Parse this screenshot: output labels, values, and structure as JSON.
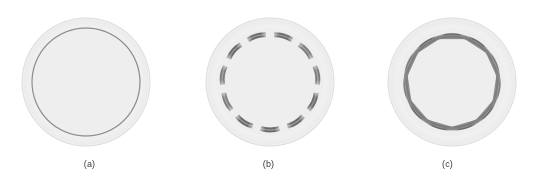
{
  "figure": {
    "width": 537,
    "height": 192,
    "background_color": "#ffffff",
    "panel_count": 3
  },
  "colors": {
    "background": "#ffffff",
    "outer_disc_fill": "#f2f2f2",
    "outer_disc_edge": "#dcdcdc",
    "inner_disc_fill": "#eeeeee",
    "thin_ring_stroke": "#8c8c8c",
    "segment_dark": "#7d7d7d",
    "segment_darker": "#6a6a6a",
    "segment_light": "#b4b4b4",
    "caption_text": "#3a3a3a"
  },
  "panels": [
    {
      "id": "panel-a",
      "caption": "(a)",
      "center_x": 86,
      "center_y": 82,
      "outer_radius": 64,
      "inner_radius": 54,
      "state": "unbuckled",
      "ring_style": "thin-continuous-circle",
      "segment_count": 0,
      "segment_thickness": 1.2,
      "polygon_amplitude": 0
    },
    {
      "id": "panel-b",
      "caption": "(b)",
      "center_x": 270,
      "center_y": 82,
      "outer_radius": 64,
      "inner_radius": 54,
      "state": "partially-buckled",
      "ring_style": "polygonal-with-detached-lobes",
      "segment_count": 11,
      "segment_thickness": 5.0,
      "polygon_amplitude": 5.5,
      "lobe_gap_fraction": 0.16
    },
    {
      "id": "panel-c",
      "caption": "(c)",
      "center_x": 452,
      "center_y": 82,
      "outer_radius": 64,
      "inner_radius": 54,
      "state": "fully-buckled",
      "ring_style": "polygonal-continuous",
      "segment_count": 11,
      "segment_thickness": 4.2,
      "polygon_amplitude": 7.5,
      "lobe_gap_fraction": 0.02
    }
  ]
}
